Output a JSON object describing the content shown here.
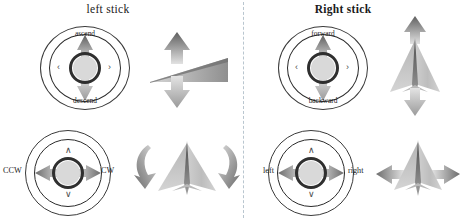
{
  "figure": {
    "background": "#ffffff",
    "width": 462,
    "height": 220,
    "divider": "vertical-dashed-line",
    "divider_color": "#b9c6cf"
  },
  "panels": [
    {
      "id": "left-stick",
      "title": "left stick",
      "rows": [
        {
          "id": "throttle",
          "joystick": {
            "ring_label_top": "ascend",
            "ring_label_bottom": "descend",
            "axis": "vertical",
            "active_arrows": [
              "up",
              "down"
            ],
            "idle_chevron_left": "‹",
            "idle_chevron_right": "›"
          },
          "craft": {
            "name": "drone-side-view-climb",
            "arrow_up": "ascend-arrow",
            "arrow_down": "descend-arrow"
          }
        },
        {
          "id": "yaw",
          "joystick": {
            "side_label_left": "CCW",
            "side_label_right": "CW",
            "axis": "horizontal",
            "active_arrows": [
              "left",
              "right"
            ],
            "idle_chevron_up": "∧",
            "idle_chevron_down": "∨"
          },
          "craft": {
            "name": "drone-top-view-yaw",
            "arrow_left": "rotate-counter-clockwise-arrow",
            "arrow_right": "rotate-clockwise-arrow"
          }
        }
      ]
    },
    {
      "id": "right-stick",
      "title": "Right stick",
      "rows": [
        {
          "id": "pitch",
          "joystick": {
            "ring_label_top": "forward",
            "ring_label_bottom": "backward",
            "axis": "vertical",
            "active_arrows": [
              "up",
              "down"
            ],
            "idle_chevron_left": "‹",
            "idle_chevron_right": "›"
          },
          "craft": {
            "name": "drone-top-view-pitch",
            "arrow_up": "forward-arrow",
            "arrow_down": "backward-arrow"
          }
        },
        {
          "id": "roll",
          "joystick": {
            "side_label_left": "left",
            "side_label_right": "right",
            "axis": "horizontal",
            "active_arrows": [
              "left",
              "right"
            ],
            "idle_chevron_up": "∧",
            "idle_chevron_down": "∨"
          },
          "craft": {
            "name": "drone-top-view-roll",
            "arrow_left": "strafe-left-arrow",
            "arrow_right": "strafe-right-arrow"
          }
        }
      ]
    }
  ],
  "palette": {
    "ink": "#2b2b2b",
    "hub_fill": "#d9d9d9",
    "arrow_dark": "#6e6e6e",
    "arrow_light": "#d8d8d8",
    "craft_fill": "#c9c9c9",
    "craft_edge": "#8a8a8a"
  }
}
